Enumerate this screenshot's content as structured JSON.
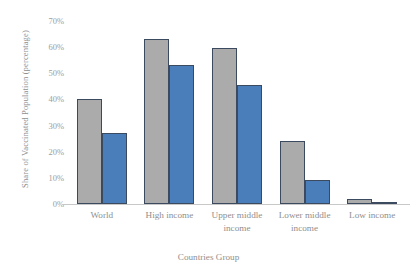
{
  "chart_data": {
    "type": "bar",
    "title": "",
    "xlabel": "Countries Group",
    "ylabel": "Share of Vaccinated Population (percentage)",
    "categories": [
      "World",
      "High income",
      "Upper middle income",
      "Lower middle income",
      "Low income"
    ],
    "series": [
      {
        "name": "series-1",
        "color": "#ababab",
        "values": [
          40,
          63,
          59.5,
          24,
          2
        ]
      },
      {
        "name": "series-2",
        "color": "#4a7ebb",
        "values": [
          27,
          53,
          45.5,
          9,
          0.7
        ]
      }
    ],
    "ylim": [
      0,
      70
    ],
    "ytick_labels": [
      "70%",
      "60%",
      "50%",
      "40%",
      "30%",
      "20%",
      "10%",
      "0%"
    ],
    "ytick_values": [
      70,
      60,
      50,
      40,
      30,
      20,
      10,
      0
    ],
    "grid": false,
    "legend": "none",
    "bar_outline_color": "#3b4a5e",
    "axis_color": "#c8c8c8",
    "text_color": "#8f8f8f"
  }
}
